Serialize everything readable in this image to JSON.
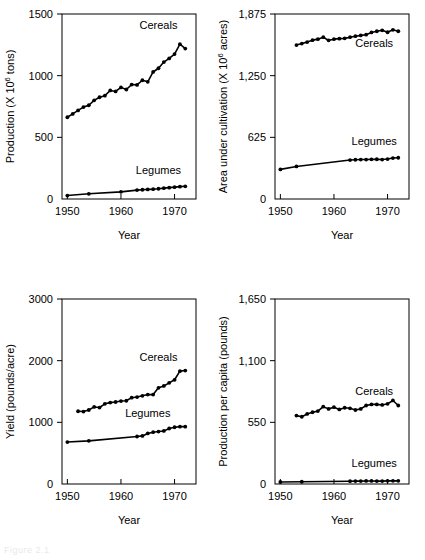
{
  "figure": {
    "caption": "Figure 2.1",
    "panel_count": 4
  },
  "chart_data": [
    {
      "id": "production",
      "position": "top-left",
      "type": "line",
      "title": "",
      "xlabel": "Year",
      "ylabel": "Production (X 10⁶ tons)",
      "ylabel_prefix": "Production (X 10",
      "ylabel_exponent": "6",
      "ylabel_suffix": " tons)",
      "xlim": [
        1949,
        1974
      ],
      "ylim": [
        0,
        1500
      ],
      "xticks": [
        1950,
        1960,
        1970
      ],
      "xtick_labels": [
        "1950",
        "1960",
        "1970"
      ],
      "yticks": [
        0,
        500,
        1000,
        1500
      ],
      "ytick_labels": [
        "0",
        "500",
        "1000",
        "1500"
      ],
      "grid": false,
      "legend_position": "inline-right",
      "series": [
        {
          "name": "Cereals",
          "label_x": 1967.0,
          "label_y": 1375,
          "x": [
            1950,
            1951,
            1952,
            1953,
            1954,
            1955,
            1956,
            1957,
            1958,
            1959,
            1960,
            1961,
            1962,
            1963,
            1964,
            1965,
            1966,
            1967,
            1968,
            1969,
            1970,
            1971,
            1972
          ],
          "values": [
            663,
            690,
            718,
            745,
            760,
            800,
            825,
            838,
            880,
            872,
            905,
            888,
            928,
            925,
            963,
            950,
            1030,
            1060,
            1110,
            1140,
            1175,
            1255,
            1220
          ]
        },
        {
          "name": "Legumes",
          "label_x": 1967.0,
          "label_y": 200,
          "x": [
            1950,
            1954,
            1960,
            1963,
            1964,
            1965,
            1966,
            1967,
            1968,
            1969,
            1970,
            1971,
            1972
          ],
          "values": [
            28,
            42,
            58,
            72,
            75,
            78,
            80,
            83,
            88,
            92,
            96,
            100,
            103
          ]
        }
      ]
    },
    {
      "id": "area-under-cultivation",
      "position": "top-right",
      "type": "line",
      "title": "",
      "xlabel": "Year",
      "ylabel": "Area under cultivation (X 10⁶ acres)",
      "ylabel_prefix": "Area under cultivation (X 10",
      "ylabel_exponent": "6",
      "ylabel_suffix": " acres)",
      "xlim": [
        1949,
        1974
      ],
      "ylim": [
        0,
        1875
      ],
      "xticks": [
        1950,
        1960,
        1970
      ],
      "xtick_labels": [
        "1950",
        "1960",
        "1970"
      ],
      "yticks": [
        0,
        625,
        1250,
        1875
      ],
      "ytick_labels": [
        "0",
        "625",
        "1,250",
        "1,875"
      ],
      "grid": false,
      "legend_position": "inline-right",
      "series": [
        {
          "name": "Cereals",
          "label_x": 1967.5,
          "label_y": 1540,
          "x": [
            1953,
            1954,
            1955,
            1956,
            1957,
            1958,
            1959,
            1960,
            1961,
            1962,
            1963,
            1964,
            1965,
            1966,
            1967,
            1968,
            1969,
            1970,
            1971,
            1972
          ],
          "values": [
            1560,
            1575,
            1590,
            1610,
            1620,
            1640,
            1608,
            1620,
            1625,
            1628,
            1640,
            1650,
            1658,
            1665,
            1688,
            1700,
            1710,
            1690,
            1715,
            1700
          ]
        },
        {
          "name": "Legumes",
          "label_x": 1967.5,
          "label_y": 545,
          "x": [
            1950,
            1953,
            1963,
            1964,
            1965,
            1966,
            1967,
            1968,
            1969,
            1970,
            1971,
            1972
          ],
          "values": [
            300,
            330,
            395,
            398,
            400,
            400,
            402,
            403,
            400,
            405,
            415,
            418
          ]
        }
      ]
    },
    {
      "id": "yield",
      "position": "bottom-left",
      "type": "line",
      "title": "",
      "xlabel": "Year",
      "ylabel": "Yield (pounds/acre)",
      "ylabel_prefix": "Yield (pounds/acre)",
      "ylabel_exponent": "",
      "ylabel_suffix": "",
      "xlim": [
        1949,
        1974
      ],
      "ylim": [
        0,
        3000
      ],
      "xticks": [
        1950,
        1960,
        1970
      ],
      "xtick_labels": [
        "1950",
        "1960",
        "1970"
      ],
      "yticks": [
        0,
        1000,
        2000,
        3000
      ],
      "ytick_labels": [
        "0",
        "1000",
        "2000",
        "3000"
      ],
      "grid": false,
      "legend_position": "inline-right",
      "series": [
        {
          "name": "Cereals",
          "label_x": 1967.0,
          "label_y": 2000,
          "x": [
            1952,
            1953,
            1954,
            1955,
            1956,
            1957,
            1958,
            1959,
            1960,
            1961,
            1962,
            1963,
            1964,
            1965,
            1966,
            1967,
            1968,
            1969,
            1970,
            1971,
            1972
          ],
          "values": [
            1180,
            1175,
            1200,
            1250,
            1240,
            1300,
            1320,
            1330,
            1345,
            1350,
            1400,
            1410,
            1430,
            1450,
            1450,
            1560,
            1590,
            1640,
            1690,
            1830,
            1840
          ]
        },
        {
          "name": "Legumes",
          "label_x": 1965.0,
          "label_y": 1090,
          "x": [
            1950,
            1954,
            1963,
            1964,
            1965,
            1966,
            1967,
            1968,
            1969,
            1970,
            1971,
            1972
          ],
          "values": [
            680,
            700,
            770,
            780,
            820,
            840,
            850,
            860,
            900,
            920,
            930,
            930
          ]
        }
      ]
    },
    {
      "id": "production-per-capita",
      "position": "bottom-right",
      "type": "line",
      "title": "",
      "xlabel": "Year",
      "ylabel": "Production per capita (pounds)",
      "ylabel_prefix": "Production per capita (pounds)",
      "ylabel_exponent": "",
      "ylabel_suffix": "",
      "xlim": [
        1949,
        1974
      ],
      "ylim": [
        0,
        1650
      ],
      "xticks": [
        1950,
        1960,
        1970
      ],
      "xtick_labels": [
        "1950",
        "1960",
        "1970"
      ],
      "yticks": [
        0,
        550,
        1100,
        1650
      ],
      "ytick_labels": [
        "0",
        "550",
        "1,100",
        "1,650"
      ],
      "grid": false,
      "legend_position": "inline-right",
      "series": [
        {
          "name": "Cereals",
          "label_x": 1967.5,
          "label_y": 790,
          "x": [
            1953,
            1954,
            1955,
            1956,
            1957,
            1958,
            1959,
            1960,
            1961,
            1962,
            1963,
            1964,
            1965,
            1966,
            1967,
            1968,
            1969,
            1970,
            1971,
            1972
          ],
          "values": [
            610,
            600,
            625,
            640,
            650,
            690,
            670,
            685,
            665,
            680,
            675,
            660,
            670,
            700,
            710,
            710,
            705,
            715,
            745,
            700
          ]
        },
        {
          "name": "Legumes",
          "label_x": 1967.5,
          "label_y": 150,
          "x": [
            1950,
            1954,
            1963,
            1964,
            1965,
            1966,
            1967,
            1968,
            1969,
            1970,
            1971,
            1972
          ],
          "values": [
            18,
            20,
            25,
            26,
            26,
            27,
            27,
            26,
            26,
            28,
            28,
            28
          ]
        }
      ]
    }
  ]
}
